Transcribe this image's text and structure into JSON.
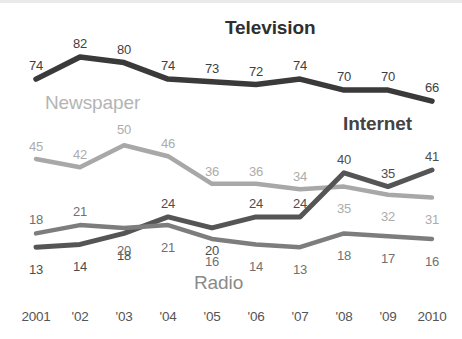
{
  "chart_data": {
    "type": "line",
    "title": "",
    "xlabel": "",
    "ylabel": "",
    "x": [
      2001,
      2002,
      2003,
      2004,
      2005,
      2006,
      2007,
      2008,
      2009,
      2010
    ],
    "categories": [
      "2001",
      "'02",
      "'03",
      "'04",
      "'05",
      "'06",
      "'07",
      "'08",
      "'09",
      "2010"
    ],
    "ylim": [
      0,
      90
    ],
    "grid": false,
    "legend_position": "inline-labels",
    "series": [
      {
        "name": "Television",
        "color": "#3a3a3a",
        "values": [
          74,
          82,
          80,
          74,
          73,
          72,
          74,
          70,
          70,
          66
        ],
        "labels": [
          "74",
          "82",
          "80",
          "74",
          "73",
          "72",
          "74",
          "70",
          "70",
          "66"
        ]
      },
      {
        "name": "Newspaper",
        "color": "#a8a8a8",
        "values": [
          45,
          42,
          50,
          46,
          36,
          36,
          34,
          35,
          32,
          31
        ],
        "labels": [
          "45",
          "42",
          "50",
          "46",
          "36",
          "36",
          "34",
          "35",
          "32",
          "31"
        ]
      },
      {
        "name": "Internet",
        "color": "#555555",
        "values": [
          13,
          14,
          18,
          24,
          20,
          24,
          24,
          40,
          35,
          41
        ],
        "labels": [
          "13",
          "14",
          "18",
          "24",
          "20",
          "24",
          "24",
          "40",
          "35",
          "41"
        ]
      },
      {
        "name": "Radio",
        "color": "#7d7d7d",
        "values": [
          18,
          21,
          20,
          21,
          16,
          14,
          13,
          18,
          17,
          16
        ],
        "labels": [
          "18",
          "21",
          "20",
          "21",
          "16",
          "14",
          "13",
          "18",
          "17",
          "16"
        ]
      }
    ]
  },
  "series_labels": {
    "television": "Television",
    "newspaper": "Newspaper",
    "internet": "Internet",
    "radio": "Radio"
  },
  "axis": {
    "ticks": [
      "2001",
      "'02",
      "'03",
      "'04",
      "'05",
      "'06",
      "'07",
      "'08",
      "'09",
      "2010"
    ]
  }
}
